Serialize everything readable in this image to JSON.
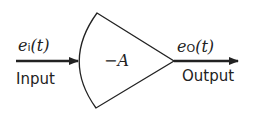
{
  "diagram": {
    "type": "amplifier-block",
    "input": {
      "signal": "e",
      "subscript": "i",
      "arg": "(t)",
      "label": "Input"
    },
    "output": {
      "signal": "e",
      "subscript": "O",
      "arg": "(t)",
      "label": "Output"
    },
    "gain": "−A",
    "colors": {
      "stroke": "#222222",
      "background": "#ffffff"
    }
  }
}
